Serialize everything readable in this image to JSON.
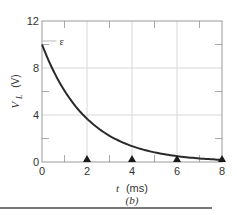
{
  "chart_data": {
    "type": "line",
    "title": "",
    "caption": "(b)",
    "xlabel": "t (ms)",
    "xlabel_var": "t",
    "xlabel_unit": "(ms)",
    "ylabel": "V_L (V)",
    "ylabel_var": "V",
    "ylabel_sub": "L",
    "ylabel_unit": "(V)",
    "xlim": [
      0,
      8
    ],
    "ylim": [
      0,
      12
    ],
    "x_ticks": [
      0,
      2,
      4,
      6,
      8
    ],
    "y_ticks": [
      0,
      4,
      8,
      12
    ],
    "x_tick_labels": [
      "0",
      "2",
      "4",
      "6",
      "8"
    ],
    "y_tick_labels": [
      "0",
      "4",
      "8",
      "12"
    ],
    "grid": true,
    "annotation": {
      "text": "ε",
      "x": 0.6,
      "y": 10.3
    },
    "markers": {
      "shape": "triangle-up",
      "x": [
        2,
        4,
        6,
        8
      ],
      "y": 0
    },
    "series": [
      {
        "name": "V_L",
        "x": [
          0,
          0.5,
          1,
          1.5,
          2,
          2.5,
          3,
          3.5,
          4,
          4.5,
          5,
          5.5,
          6,
          6.5,
          7,
          7.5,
          8
        ],
        "values": [
          10.0,
          7.79,
          6.07,
          4.72,
          3.68,
          2.87,
          2.23,
          1.74,
          1.35,
          1.05,
          0.82,
          0.64,
          0.5,
          0.39,
          0.3,
          0.24,
          0.18
        ]
      }
    ],
    "colors": {
      "curve": "#2a2a2a",
      "grid": "#d8d8d8",
      "axis": "#888888",
      "marker": "#1a1a1a"
    }
  }
}
